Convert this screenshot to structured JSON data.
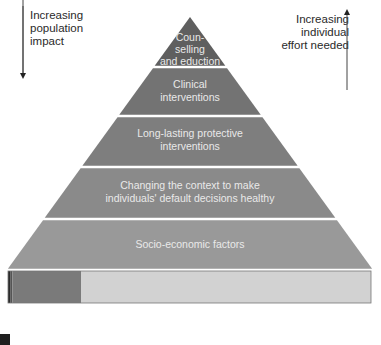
{
  "left_axis": {
    "label": [
      "Increasing",
      "population",
      "impact"
    ],
    "arrow_direction": "down"
  },
  "right_axis": {
    "label": [
      "Increasing",
      "individual",
      "effort needed"
    ],
    "arrow_direction": "up"
  },
  "pyramid": {
    "tiers": [
      {
        "label": [
          "Coun-",
          "selling",
          "and eduction"
        ],
        "color": "#5f5f5f"
      },
      {
        "label": [
          "Clinical",
          "interventions"
        ],
        "color": "#737373"
      },
      {
        "label": [
          "Long-lasting protective",
          "interventions"
        ],
        "color": "#7e7e7e"
      },
      {
        "label": [
          "Changing the context to make",
          "individuals' default decisions healthy"
        ],
        "color": "#8a8a8a"
      },
      {
        "label": [
          "Socio-economic factors"
        ],
        "color": "#999999"
      }
    ],
    "separator_color": "#f2f2f2"
  },
  "base_bar": {
    "segments": [
      {
        "name": "darkest",
        "share": 0.006,
        "color": "#2b2b2b"
      },
      {
        "name": "dark",
        "share": 0.006,
        "color": "#555555"
      },
      {
        "name": "medium",
        "share": 0.19,
        "color": "#7a7a7a"
      },
      {
        "name": "light",
        "share": 0.798,
        "color": "#d2d2d2"
      }
    ]
  },
  "legend": {
    "swatch_color": "#1f1f1f",
    "text": ""
  }
}
